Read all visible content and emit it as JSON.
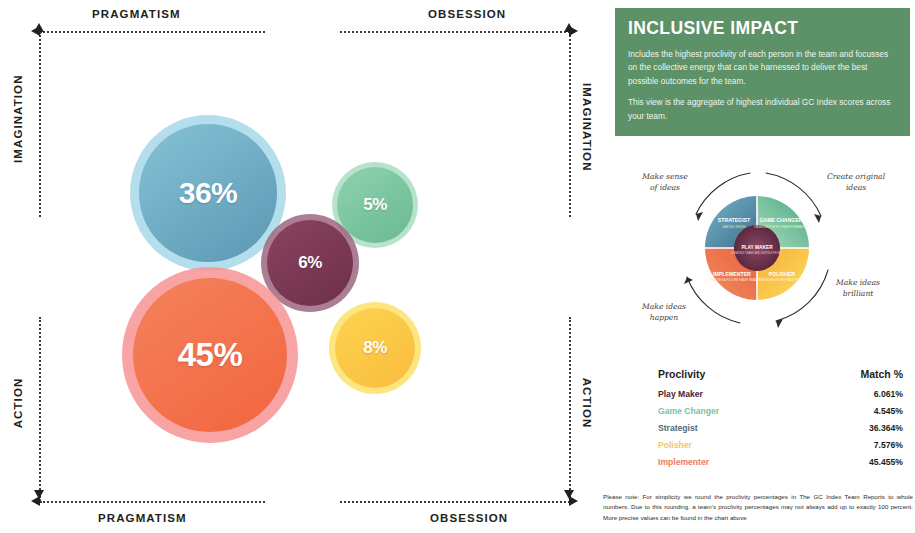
{
  "chart_data": {
    "type": "bar",
    "chart_style": "bubble-quadrant",
    "title": "Inclusive Impact",
    "categories": [
      "Strategist",
      "Game Changer",
      "Play Maker",
      "Implementer",
      "Polisher"
    ],
    "values": [
      36,
      5,
      6,
      45,
      8
    ],
    "labels": [
      "36%",
      "5%",
      "6%",
      "45%",
      "8%"
    ],
    "colors": [
      "#5b97b3",
      "#67b88f",
      "#6e2f48",
      "#f2653f",
      "#fbbc3e"
    ],
    "halo_colors": [
      "#a7d8e8",
      "#a6ddbd",
      "#9c6780",
      "#f79494",
      "#fde06a"
    ],
    "xlabel": "",
    "ylabel": "",
    "axis_quadrants": {
      "top_left": "PRAGMATISM",
      "top_right": "OBSESSION",
      "bottom_left": "PRAGMATISM",
      "bottom_right": "OBSESSION",
      "left_top": "IMAGINATION",
      "left_bottom": "ACTION",
      "right_top": "IMAGINATION",
      "right_bottom": "ACTION"
    },
    "grid": false,
    "legend": "none"
  },
  "axes": {
    "top_left": "PRAGMATISM",
    "top_right": "OBSESSION",
    "bottom_left": "PRAGMATISM",
    "bottom_right": "OBSESSION",
    "left_top": "IMAGINATION",
    "left_bottom": "ACTION",
    "right_top": "IMAGINATION",
    "right_bottom": "ACTION"
  },
  "bubbles": [
    {
      "label": "36%",
      "name": "Strategist",
      "value": 36,
      "cx": 208,
      "cy": 193,
      "r": 78,
      "core": "#5b97b3",
      "core2": "#86c3d6",
      "halo": "#a7d8e8",
      "font": 30
    },
    {
      "label": "5%",
      "name": "Game Changer",
      "value": 5,
      "cx": 375,
      "cy": 205,
      "r": 43,
      "core": "#69b992",
      "core2": "#8fd2b0",
      "halo": "#a9dec0",
      "font": 17
    },
    {
      "label": "6%",
      "name": "Play Maker",
      "value": 6,
      "cx": 310,
      "cy": 263,
      "r": 49,
      "core": "#6e2f48",
      "core2": "#8a4460",
      "halo": "#9c6780",
      "font": 17
    },
    {
      "label": "45%",
      "name": "Implementer",
      "value": 45,
      "cx": 210,
      "cy": 355,
      "r": 88,
      "core": "#f2653f",
      "core2": "#f4825c",
      "halo": "#f79494",
      "font": 33
    },
    {
      "label": "8%",
      "name": "Polisher",
      "value": 8,
      "cx": 375,
      "cy": 348,
      "r": 46,
      "core": "#fbbc3e",
      "core2": "#fbd44f",
      "halo": "#fde06a",
      "font": 17
    }
  ],
  "impact_card": {
    "title": "INCLUSIVE IMPACT",
    "paragraph1": "Includes the highest proclivity of each person in the team and focusses on the collective energy that can be harnessed to deliver the best possible outcomes for the team.",
    "paragraph2": "This view is the aggregate of highest individual GC Index scores across your team.",
    "background": "#5d9268"
  },
  "wheel": {
    "center_label": "PLAY MAKER",
    "center_sub": "CREATING TEAMS AND UNITING PEOPLE",
    "center_color": "#6e2f48",
    "quadrants": [
      {
        "name": "STRATEGIST",
        "sub": "MAKING SENSE",
        "color": "#5b97b3",
        "position": "top-left"
      },
      {
        "name": "GAME CHANGER",
        "sub": "OBSESSED WITH TRANSFORMATION",
        "color": "#69b992",
        "position": "top-right"
      },
      {
        "name": "POLISHER",
        "sub": "CREATING A FUTURE MADE PERFECT",
        "color": "#fbbc3e",
        "position": "bottom-right"
      },
      {
        "name": "IMPLEMENTER",
        "sub": "CREATING A FUTURE MADE REAL",
        "color": "#f2653f",
        "position": "bottom-left"
      }
    ],
    "annotations": {
      "top_left": "Make sense\nof ideas",
      "top_right": "Create original\nideas",
      "bottom_right": "Make ideas\nbrilliant",
      "bottom_left": "Make ideas\nhappen"
    }
  },
  "table": {
    "headers": {
      "proclivity": "Proclivity",
      "match": "Match %"
    },
    "rows": [
      {
        "proclivity": "Play Maker",
        "match": "6.061%",
        "color": "#4a2130"
      },
      {
        "proclivity": "Game Changer",
        "match": "4.545%",
        "color": "#7cc3a0"
      },
      {
        "proclivity": "Strategist",
        "match": "36.364%",
        "color": "#4e6a7a"
      },
      {
        "proclivity": "Polisher",
        "match": "7.576%",
        "color": "#f7c55e"
      },
      {
        "proclivity": "Implementer",
        "match": "45.455%",
        "color": "#ef7a5e"
      }
    ]
  },
  "footnote": "Please note: For simplicity we round the proclivity percentages in The GC Index Team Reports to whole numbers. Due to this rounding, a team's proclivity percentages may not always add up to exactly 100 percent. More precise values can be found in the chart above"
}
